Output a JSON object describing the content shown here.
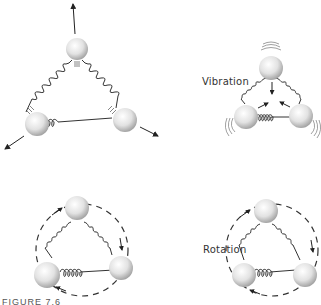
{
  "labels": {
    "vibration": "Vibration",
    "rotation": "Rotation"
  },
  "caption": "FIGURE 7.6",
  "colors": {
    "ball_light": "#ffffff",
    "ball_dark": "#a8a8a8",
    "spring": "#333333",
    "arrow": "#222222"
  },
  "panels": [
    {
      "id": "vibration-stretch",
      "mode": "vibration",
      "atoms": 3,
      "arrows": "outward"
    },
    {
      "id": "vibration-compress",
      "mode": "vibration",
      "atoms": 3,
      "arrows": "inward",
      "motion_lines": true
    },
    {
      "id": "rotation-clockwise-1",
      "mode": "rotation",
      "atoms": 3,
      "path": "dashed-circle"
    },
    {
      "id": "rotation-clockwise-2",
      "mode": "rotation",
      "atoms": 3,
      "path": "dashed-circle"
    }
  ]
}
